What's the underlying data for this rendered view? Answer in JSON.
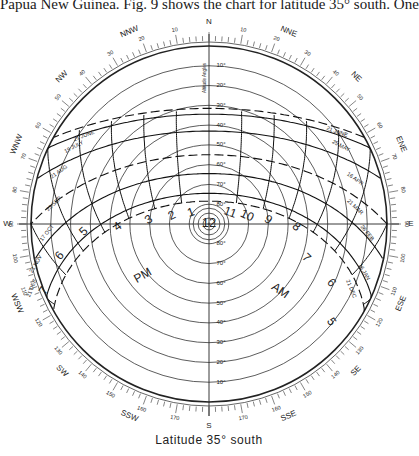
{
  "header": {
    "caption": "Papua New Guinea. Fig. 9 shows the chart for latitude 35° south. One"
  },
  "footer": {
    "caption": "Latitude   35°  south"
  },
  "diagram": {
    "title": "Latitude 35° south",
    "type": "sun-path-chart",
    "center": [
      209,
      224
    ],
    "radius": 178,
    "compass_points": [
      {
        "label": "N",
        "az": 0
      },
      {
        "label": "NNE",
        "az": 22.5
      },
      {
        "label": "NE",
        "az": 45
      },
      {
        "label": "ENE",
        "az": 67.5
      },
      {
        "label": "E",
        "az": 90
      },
      {
        "label": "ESE",
        "az": 112.5
      },
      {
        "label": "SE",
        "az": 135
      },
      {
        "label": "SSE",
        "az": 157.5
      },
      {
        "label": "S",
        "az": 180
      },
      {
        "label": "SSW",
        "az": 202.5
      },
      {
        "label": "SW",
        "az": 225
      },
      {
        "label": "WSW",
        "az": 247.5
      },
      {
        "label": "W",
        "az": 270
      },
      {
        "label": "WNW",
        "az": 292.5
      },
      {
        "label": "NW",
        "az": 315
      },
      {
        "label": "NNW",
        "az": 337.5
      }
    ],
    "bearing_labels": [
      "0",
      "10",
      "20",
      "30",
      "40",
      "50",
      "60",
      "70",
      "80",
      "90",
      "100",
      "110",
      "120",
      "130",
      "140",
      "150",
      "160",
      "170",
      "180"
    ],
    "altitude_axis_label": "Altitude Angles",
    "altitude_labels": [
      "10°",
      "20°",
      "30°",
      "40°",
      "50°",
      "60°",
      "70°",
      "80°"
    ],
    "date_lines": [
      {
        "label": "21 JUNE",
        "side": "left",
        "dashed": true
      },
      {
        "label": "19 JULY",
        "side": "left",
        "dashed": false
      },
      {
        "label": "21 AUG",
        "side": "left",
        "dashed": false
      },
      {
        "label": "23 SEP",
        "side": "left",
        "dashed": true
      },
      {
        "label": "17 OCT",
        "side": "left",
        "dashed": false
      },
      {
        "label": "21 NOV",
        "side": "left",
        "dashed": false
      },
      {
        "label": "21 DEC",
        "side": "left",
        "dashed": true
      },
      {
        "label": "21 JUNE",
        "side": "right",
        "dashed": true
      },
      {
        "label": "25 MAY",
        "side": "right",
        "dashed": false
      },
      {
        "label": "16 APR",
        "side": "right",
        "dashed": false
      },
      {
        "label": "21 MAR",
        "side": "right",
        "dashed": true
      },
      {
        "label": "26 FEB",
        "side": "right",
        "dashed": false
      },
      {
        "label": "16 JAN",
        "side": "right",
        "dashed": false
      },
      {
        "label": "21 DEC",
        "side": "right",
        "dashed": true
      }
    ],
    "hour_labels": {
      "pm": [
        "1",
        "2",
        "3",
        "4",
        "5",
        "6",
        "7"
      ],
      "am": [
        "11",
        "10",
        "9",
        "8",
        "7",
        "6",
        "5"
      ],
      "noon": "12"
    },
    "period_labels": {
      "am": "AM",
      "pm": "PM"
    }
  }
}
